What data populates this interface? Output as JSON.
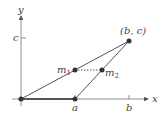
{
  "diagram": {
    "axes": {
      "x_label": "x",
      "y_label": "y"
    },
    "ticks": {
      "x_a": "a",
      "x_b": "b",
      "y_c": "c"
    },
    "points": {
      "origin": "",
      "a": "",
      "bc": "(b, c)",
      "m1": "m",
      "m1_sub": "1",
      "m2": "m",
      "m2_sub": "2"
    },
    "colors": {
      "line": "#555555",
      "point": "#333333",
      "axis": "#666666"
    }
  }
}
